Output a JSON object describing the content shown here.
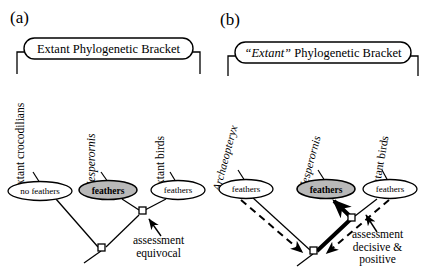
{
  "figure": {
    "background": "#ffffff",
    "stroke": "#000000",
    "shaded_fill": "#b9b9b9"
  },
  "panels": [
    {
      "id": "a",
      "label": "(a)",
      "bracket_label": "Extant Phylogenetic Bracket",
      "bracket_label_italic_part": "",
      "taxa": [
        {
          "name": "extant crocodilians",
          "italic": false
        },
        {
          "name": "Hesperornis",
          "italic": true
        },
        {
          "name": "extant birds",
          "italic": false
        }
      ],
      "character_states": [
        {
          "text": "no feathers",
          "shaded": false,
          "bold": false
        },
        {
          "text": "feathers",
          "shaded": true,
          "bold": true
        },
        {
          "text": "feathers",
          "shaded": false,
          "bold": false
        }
      ],
      "annotation": {
        "line1": "assessment",
        "line2": "equivocal",
        "line3": ""
      },
      "arrow_style": "thin-solid-pointer"
    },
    {
      "id": "b",
      "label": "(b)",
      "bracket_label": "Phylogenetic Bracket",
      "bracket_label_italic_part": "“Extant”",
      "taxa": [
        {
          "name": "Archaeopteryx",
          "italic": true
        },
        {
          "name": "Hesperornis",
          "italic": true
        },
        {
          "name": "extant birds",
          "italic": false
        }
      ],
      "character_states": [
        {
          "text": "feathers",
          "shaded": false,
          "bold": false
        },
        {
          "text": "feathers",
          "shaded": true,
          "bold": true
        },
        {
          "text": "feathers",
          "shaded": false,
          "bold": false
        }
      ],
      "annotation": {
        "line1": "assessment",
        "line2": "decisive &",
        "line3": "positive"
      },
      "arrow_style": "dashed-inference-and-thick-solid"
    }
  ]
}
